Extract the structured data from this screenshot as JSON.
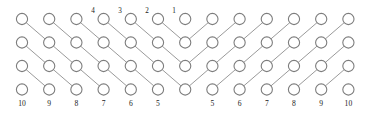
{
  "figure": {
    "name": "lattice-diagram",
    "background_color": "#ffffff",
    "circle_fill": "#ffffff",
    "circle_stroke": "#7d7d7d",
    "edge_stroke": "#9a9a9a",
    "label_color": "#1a1a1a",
    "columns": 13,
    "rows": 4,
    "circle_radius": 5.6,
    "col_x": [
      22,
      49.2,
      76.4,
      103.6,
      130.8,
      158,
      185.2,
      212.4,
      239.6,
      266.8,
      294,
      321.2,
      348.4
    ],
    "row_y": [
      19,
      42.5,
      66,
      89.5
    ],
    "top_labels": [
      {
        "text": "4",
        "col": 3,
        "x": 93,
        "y": 11
      },
      {
        "text": "3",
        "col": 4,
        "x": 120,
        "y": 11
      },
      {
        "text": "2",
        "col": 5,
        "x": 147,
        "y": 11
      },
      {
        "text": "1",
        "col": 6,
        "x": 174,
        "y": 11
      }
    ],
    "bottom_labels": [
      {
        "text": "10",
        "col": 0,
        "x": 22,
        "y": 104
      },
      {
        "text": "9",
        "col": 1,
        "x": 49.2,
        "y": 104
      },
      {
        "text": "8",
        "col": 2,
        "x": 76.4,
        "y": 104
      },
      {
        "text": "7",
        "col": 3,
        "x": 103.6,
        "y": 104
      },
      {
        "text": "6",
        "col": 4,
        "x": 130.8,
        "y": 104
      },
      {
        "text": "5",
        "col": 5,
        "x": 158,
        "y": 104
      },
      {
        "text": "5",
        "col": 7,
        "x": 212.4,
        "y": 104
      },
      {
        "text": "6",
        "col": 8,
        "x": 239.6,
        "y": 104
      },
      {
        "text": "7",
        "col": 9,
        "x": 266.8,
        "y": 104
      },
      {
        "text": "8",
        "col": 10,
        "x": 294,
        "y": 104
      },
      {
        "text": "9",
        "col": 11,
        "x": 321.2,
        "y": 104
      },
      {
        "text": "10",
        "col": 12,
        "x": 348.4,
        "y": 104
      }
    ],
    "edges_left_down_right": [
      {
        "from": {
          "row": 0,
          "col": 0
        },
        "to": {
          "row": 1,
          "col": 1
        }
      },
      {
        "from": {
          "row": 0,
          "col": 1
        },
        "to": {
          "row": 1,
          "col": 2
        }
      },
      {
        "from": {
          "row": 0,
          "col": 2
        },
        "to": {
          "row": 1,
          "col": 3
        }
      },
      {
        "from": {
          "row": 0,
          "col": 3
        },
        "to": {
          "row": 1,
          "col": 4
        }
      },
      {
        "from": {
          "row": 0,
          "col": 4
        },
        "to": {
          "row": 1,
          "col": 5
        }
      },
      {
        "from": {
          "row": 0,
          "col": 5
        },
        "to": {
          "row": 1,
          "col": 6
        }
      },
      {
        "from": {
          "row": 1,
          "col": 0
        },
        "to": {
          "row": 2,
          "col": 1
        }
      },
      {
        "from": {
          "row": 1,
          "col": 1
        },
        "to": {
          "row": 2,
          "col": 2
        }
      },
      {
        "from": {
          "row": 1,
          "col": 2
        },
        "to": {
          "row": 2,
          "col": 3
        }
      },
      {
        "from": {
          "row": 1,
          "col": 3
        },
        "to": {
          "row": 2,
          "col": 4
        }
      },
      {
        "from": {
          "row": 1,
          "col": 4
        },
        "to": {
          "row": 2,
          "col": 5
        }
      },
      {
        "from": {
          "row": 1,
          "col": 5
        },
        "to": {
          "row": 2,
          "col": 6
        }
      },
      {
        "from": {
          "row": 2,
          "col": 0
        },
        "to": {
          "row": 3,
          "col": 1
        }
      },
      {
        "from": {
          "row": 2,
          "col": 1
        },
        "to": {
          "row": 3,
          "col": 2
        }
      },
      {
        "from": {
          "row": 2,
          "col": 2
        },
        "to": {
          "row": 3,
          "col": 3
        }
      },
      {
        "from": {
          "row": 2,
          "col": 3
        },
        "to": {
          "row": 3,
          "col": 4
        }
      },
      {
        "from": {
          "row": 2,
          "col": 4
        },
        "to": {
          "row": 3,
          "col": 5
        }
      },
      {
        "from": {
          "row": 2,
          "col": 5
        },
        "to": {
          "row": 3,
          "col": 6
        }
      }
    ],
    "edges_right_down_left": [
      {
        "from": {
          "row": 0,
          "col": 7
        },
        "to": {
          "row": 1,
          "col": 6
        }
      },
      {
        "from": {
          "row": 0,
          "col": 8
        },
        "to": {
          "row": 1,
          "col": 7
        }
      },
      {
        "from": {
          "row": 0,
          "col": 9
        },
        "to": {
          "row": 1,
          "col": 8
        }
      },
      {
        "from": {
          "row": 0,
          "col": 10
        },
        "to": {
          "row": 1,
          "col": 9
        }
      },
      {
        "from": {
          "row": 0,
          "col": 11
        },
        "to": {
          "row": 1,
          "col": 10
        }
      },
      {
        "from": {
          "row": 0,
          "col": 12
        },
        "to": {
          "row": 1,
          "col": 11
        }
      },
      {
        "from": {
          "row": 1,
          "col": 7
        },
        "to": {
          "row": 2,
          "col": 6
        }
      },
      {
        "from": {
          "row": 1,
          "col": 8
        },
        "to": {
          "row": 2,
          "col": 7
        }
      },
      {
        "from": {
          "row": 1,
          "col": 9
        },
        "to": {
          "row": 2,
          "col": 8
        }
      },
      {
        "from": {
          "row": 1,
          "col": 10
        },
        "to": {
          "row": 2,
          "col": 9
        }
      },
      {
        "from": {
          "row": 1,
          "col": 11
        },
        "to": {
          "row": 2,
          "col": 10
        }
      },
      {
        "from": {
          "row": 1,
          "col": 12
        },
        "to": {
          "row": 2,
          "col": 11
        }
      },
      {
        "from": {
          "row": 2,
          "col": 7
        },
        "to": {
          "row": 3,
          "col": 6
        }
      },
      {
        "from": {
          "row": 2,
          "col": 8
        },
        "to": {
          "row": 3,
          "col": 7
        }
      },
      {
        "from": {
          "row": 2,
          "col": 9
        },
        "to": {
          "row": 3,
          "col": 8
        }
      },
      {
        "from": {
          "row": 2,
          "col": 10
        },
        "to": {
          "row": 3,
          "col": 9
        }
      },
      {
        "from": {
          "row": 2,
          "col": 11
        },
        "to": {
          "row": 3,
          "col": 10
        }
      },
      {
        "from": {
          "row": 2,
          "col": 12
        },
        "to": {
          "row": 3,
          "col": 11
        }
      }
    ]
  }
}
